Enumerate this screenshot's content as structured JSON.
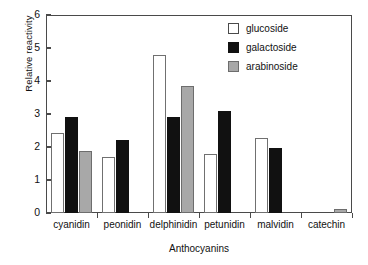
{
  "chart_data": {
    "type": "bar",
    "title": "",
    "xlabel": "Anthocyanins",
    "ylabel": "Relative reactivity",
    "categories": [
      "cyanidin",
      "peonidin",
      "delphinidin",
      "petunidin",
      "malvidin",
      "catechin"
    ],
    "series": [
      {
        "name": "glucoside",
        "color": "#ffffff",
        "values": [
          2.42,
          1.7,
          4.79,
          1.79,
          2.27,
          0
        ]
      },
      {
        "name": "galactoside",
        "color": "#111111",
        "values": [
          2.91,
          2.21,
          2.91,
          3.09,
          1.97,
          0
        ]
      },
      {
        "name": "arabinoside",
        "color": "#a8a8a8",
        "values": [
          1.88,
          0,
          3.85,
          0,
          0,
          0.13
        ]
      }
    ],
    "ylim": [
      0,
      6
    ],
    "yticks": [
      0,
      1,
      2,
      3,
      4,
      5,
      6
    ],
    "ytick_labels": [
      "0",
      "1",
      "2",
      "3",
      "4",
      "5",
      "6"
    ],
    "grid": false,
    "legend_position": "top-right"
  },
  "legend": {
    "items": [
      {
        "label": "glucoside"
      },
      {
        "label": "galactoside"
      },
      {
        "label": "arabinoside"
      }
    ]
  },
  "axes": {
    "y_title": "Relative reactivity",
    "x_title": "Anthocyanins"
  }
}
